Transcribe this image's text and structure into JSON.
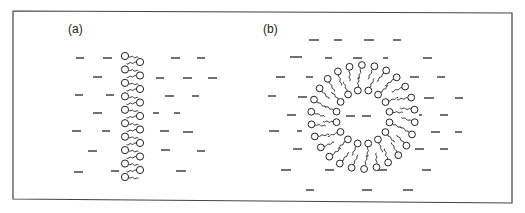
{
  "figure": {
    "frame": {
      "x": 13,
      "y": 11,
      "width": 499,
      "height": 190
    },
    "colors": {
      "ink": "#222222",
      "background": "#ffffff",
      "frame": "#444444"
    }
  },
  "panels": [
    {
      "id": "a",
      "label": "(a)",
      "label_pos": [
        68,
        33
      ],
      "structure": "lipid-bilayer",
      "bilayer": {
        "left_heads": {
          "x": 125,
          "y_start": 56,
          "y_end": 177,
          "count": 10
        },
        "right_heads": {
          "x": 140,
          "y_start": 62,
          "y_end": 170,
          "count": 9
        },
        "tail_length": 10
      },
      "molecules": [
        [
          76,
          58,
          8
        ],
        [
          103,
          58,
          9
        ],
        [
          171,
          58,
          9
        ],
        [
          197,
          58,
          8
        ],
        [
          93,
          77,
          9
        ],
        [
          156,
          78,
          8
        ],
        [
          183,
          78,
          9
        ],
        [
          208,
          78,
          9
        ],
        [
          75,
          95,
          8
        ],
        [
          106,
          95,
          8
        ],
        [
          165,
          96,
          9
        ],
        [
          192,
          96,
          7
        ],
        [
          93,
          113,
          9
        ],
        [
          153,
          113,
          6
        ],
        [
          174,
          113,
          6
        ],
        [
          72,
          131,
          9
        ],
        [
          102,
          131,
          8
        ],
        [
          160,
          131,
          9
        ],
        [
          183,
          132,
          10
        ],
        [
          88,
          151,
          9
        ],
        [
          161,
          150,
          9
        ],
        [
          197,
          151,
          8
        ],
        [
          74,
          172,
          9
        ],
        [
          111,
          171,
          8
        ],
        [
          176,
          171,
          10
        ]
      ]
    },
    {
      "id": "b",
      "label": "(b)",
      "label_pos": [
        263,
        33
      ],
      "structure": "vesicle",
      "vesicle": {
        "center": [
          363,
          117
        ],
        "outer_radius": 52,
        "inner_radius": 27,
        "outer_count": 26,
        "inner_count": 16,
        "tail_length": 14
      },
      "molecules": [
        [
          309,
          40,
          10
        ],
        [
          334,
          40,
          8
        ],
        [
          364,
          40,
          10
        ],
        [
          393,
          40,
          8
        ],
        [
          290,
          57,
          12
        ],
        [
          325,
          58,
          7
        ],
        [
          353,
          58,
          9
        ],
        [
          383,
          58,
          5
        ],
        [
          423,
          58,
          9
        ],
        [
          276,
          77,
          9
        ],
        [
          306,
          77,
          7
        ],
        [
          410,
          77,
          9
        ],
        [
          437,
          77,
          8
        ],
        [
          268,
          96,
          8
        ],
        [
          298,
          97,
          9
        ],
        [
          424,
          98,
          10
        ],
        [
          455,
          98,
          8
        ],
        [
          287,
          115,
          9
        ],
        [
          346,
          116,
          9
        ],
        [
          362,
          116,
          9
        ],
        [
          419,
          115,
          3
        ],
        [
          440,
          115,
          8
        ],
        [
          269,
          131,
          10
        ],
        [
          297,
          131,
          5
        ],
        [
          431,
          132,
          9
        ],
        [
          455,
          132,
          7
        ],
        [
          293,
          149,
          9
        ],
        [
          415,
          149,
          9
        ],
        [
          440,
          149,
          8
        ],
        [
          281,
          170,
          10
        ],
        [
          325,
          170,
          9
        ],
        [
          378,
          170,
          9
        ],
        [
          422,
          170,
          9
        ],
        [
          306,
          190,
          8
        ],
        [
          362,
          190,
          10
        ],
        [
          403,
          190,
          10
        ]
      ]
    }
  ]
}
